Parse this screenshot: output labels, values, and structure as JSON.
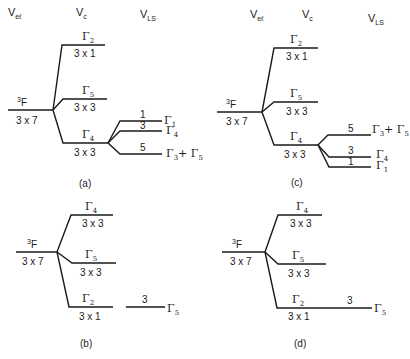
{
  "headers": {
    "vel": "V",
    "vel_sub": "eℓ",
    "vc": "V",
    "vc_sub": "c",
    "vls": "V",
    "vls_sub": "LS"
  },
  "panels": {
    "a": {
      "caption": "(a)",
      "parent": {
        "sup": "3",
        "term": "F",
        "deg": "3 x 7"
      },
      "levels": [
        {
          "gamma": "Γ",
          "sub": "2",
          "deg": "3 x 1"
        },
        {
          "gamma": "Γ",
          "sub": "5",
          "deg": "3 x 3"
        },
        {
          "gamma": "Γ",
          "sub": "4",
          "deg": "3 x 3"
        }
      ],
      "ls_split": [
        {
          "num": "1",
          "gamma": "Γ",
          "sub": "1"
        },
        {
          "num": "3",
          "gamma": "Γ",
          "sub": "4"
        },
        {
          "num": "5",
          "gamma": "Γ",
          "sub": "3",
          "plus": "+ Γ",
          "sub2": "5"
        }
      ]
    },
    "b": {
      "caption": "(b)",
      "parent": {
        "sup": "3",
        "term": "F",
        "deg": "3 x 7"
      },
      "levels": [
        {
          "gamma": "Γ",
          "sub": "4",
          "deg": "3 x 3"
        },
        {
          "gamma": "Γ",
          "sub": "5",
          "deg": "3 x 3"
        },
        {
          "gamma": "Γ",
          "sub": "2",
          "deg": "3 x 1"
        }
      ],
      "ls_split": [
        {
          "num": "3",
          "gamma": "Γ",
          "sub": "5"
        }
      ]
    },
    "c": {
      "caption": "(c)",
      "parent": {
        "sup": "3",
        "term": "F",
        "deg": "3 x 7"
      },
      "levels": [
        {
          "gamma": "Γ",
          "sub": "2",
          "deg": "3 x 1"
        },
        {
          "gamma": "Γ",
          "sub": "5",
          "deg": "3 x 3"
        },
        {
          "gamma": "Γ",
          "sub": "4",
          "deg": "3 x 3"
        }
      ],
      "ls_split": [
        {
          "num": "5",
          "gamma": "Γ",
          "sub": "3",
          "plus": "+ Γ",
          "sub2": "5"
        },
        {
          "num": "3",
          "gamma": "Γ",
          "sub": "4"
        },
        {
          "num": "1",
          "gamma": "Γ",
          "sub": "1"
        }
      ]
    },
    "d": {
      "caption": "(d)",
      "parent": {
        "sup": "3",
        "term": "F",
        "deg": "3 x 7"
      },
      "levels": [
        {
          "gamma": "Γ",
          "sub": "4",
          "deg": "3 x 3"
        },
        {
          "gamma": "Γ",
          "sub": "5",
          "deg": "3 x 3"
        },
        {
          "gamma": "Γ",
          "sub": "2",
          "deg": "3 x 1"
        }
      ],
      "ls_split": [
        {
          "num": "3",
          "gamma": "Γ",
          "sub": "5"
        }
      ]
    }
  }
}
